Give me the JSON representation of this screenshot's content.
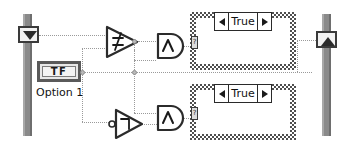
{
  "diagram": {
    "background_color": "#ffffff",
    "wire_color": "#9a9a9a",
    "structure_border_color": "#8a8a8a"
  },
  "left_structure": {
    "name": "while-loop-left-border",
    "tunnel": {
      "name": "left-tunnel",
      "icon": "triangle-down-icon",
      "glyph": "▼"
    }
  },
  "right_structure": {
    "name": "while-loop-right-border",
    "tunnel": {
      "name": "right-tunnel",
      "icon": "triangle-up-icon",
      "glyph": "▲"
    }
  },
  "boolean_terminal": {
    "name": "boolean-control-terminal",
    "value": "TF",
    "label": "Option 1"
  },
  "nodes": [
    {
      "name": "not-equal-function",
      "symbol": "≠",
      "kind": "comparison",
      "shape": "triangle-right"
    },
    {
      "name": "and-function-top",
      "symbol": "∧",
      "kind": "boolean",
      "shape": "and-gate"
    },
    {
      "name": "not-function",
      "symbol": "¬",
      "kind": "boolean",
      "shape": "triangle-right-inverted-input"
    },
    {
      "name": "and-function-bottom",
      "symbol": "∧",
      "kind": "boolean",
      "shape": "and-gate"
    }
  ],
  "case_structures": [
    {
      "name": "case-structure-top",
      "selector_label": "True",
      "left_arrow": "◀",
      "right_arrow": "▶",
      "selector_terminal": "?"
    },
    {
      "name": "case-structure-bottom",
      "selector_label": "True",
      "left_arrow": "◀",
      "right_arrow": "▶",
      "selector_terminal": "?"
    }
  ]
}
